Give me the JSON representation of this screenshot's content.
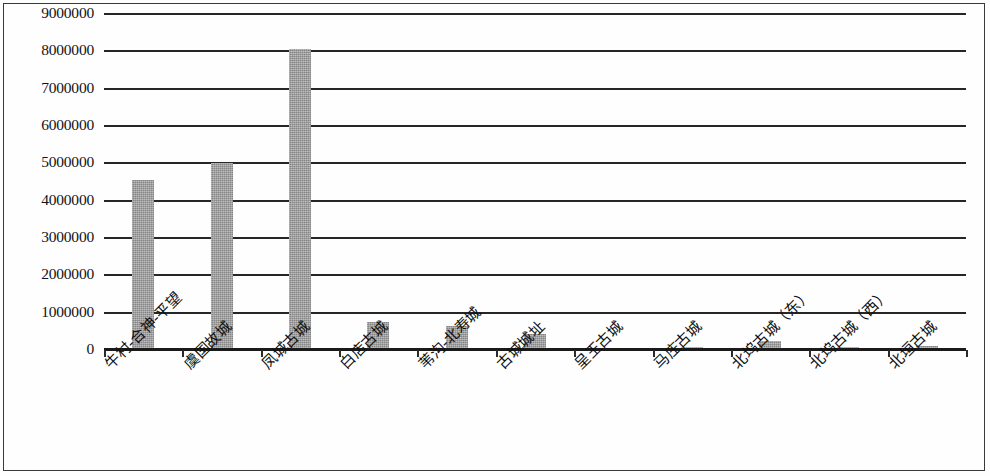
{
  "chart_data": {
    "type": "bar",
    "title": "",
    "subtitle": "",
    "xlabel": "",
    "ylabel": "",
    "ylim": [
      0,
      9000000
    ],
    "grid": true,
    "legend": false,
    "legend_position": "none",
    "bar_color": "#9a9a9a",
    "axis_color": "#262626",
    "ytick_labels": [
      "9000000",
      "8000000",
      "7000000",
      "6000000",
      "5000000",
      "4000000",
      "3000000",
      "2000000",
      "1000000",
      "0"
    ],
    "ytick_values": [
      9000000,
      8000000,
      7000000,
      6000000,
      5000000,
      4000000,
      3000000,
      2000000,
      1000000,
      0
    ],
    "categories": [
      "牛村-合神-平望",
      "虞国故城",
      "凤城古城",
      "白店古城",
      "苇沟-北寿城",
      "古城城址",
      "呈王古城",
      "马庄古城",
      "北坞古城（东）",
      "北坞古城（西）",
      "北垣古城"
    ],
    "values": [
      4550000,
      5000000,
      8050000,
      750000,
      650000,
      430000,
      60000,
      85000,
      230000,
      70000,
      110000
    ]
  },
  "axis": {
    "y_top_label": "9000000",
    "y_zero_label": "0"
  }
}
